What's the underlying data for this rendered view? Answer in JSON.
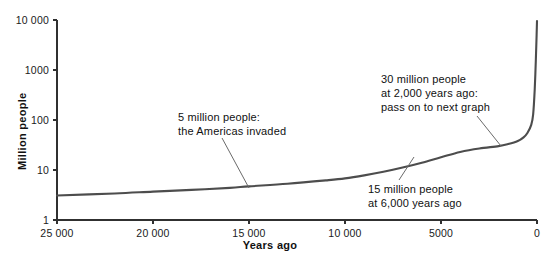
{
  "chart_data": {
    "type": "line",
    "title": "",
    "xlabel": "Years ago",
    "ylabel": "Million people",
    "xlim": [
      25000,
      0
    ],
    "ylim": [
      1,
      10000
    ],
    "yscale": "log",
    "xscale": "linear",
    "x_reversed": true,
    "grid": false,
    "legend": null,
    "xticks": [
      {
        "value": 25000,
        "label": "25 000",
        "px": 57
      },
      {
        "value": 20000,
        "label": "20 000",
        "px": 153
      },
      {
        "value": 15000,
        "label": "15 000",
        "px": 249
      },
      {
        "value": 10000,
        "label": "10 000",
        "px": 345
      },
      {
        "value": 5000,
        "label": "5000",
        "px": 441
      },
      {
        "value": 0,
        "label": "0",
        "px": 537
      }
    ],
    "yticks": [
      {
        "value": 1,
        "label": "1",
        "px": 220
      },
      {
        "value": 10,
        "label": "10",
        "px": 170
      },
      {
        "value": 100,
        "label": "100",
        "px": 120
      },
      {
        "value": 1000,
        "label": "1000",
        "px": 70
      },
      {
        "value": 10000,
        "label": "10 000",
        "px": 20
      }
    ],
    "series": [
      {
        "name": "World population",
        "units": "million people",
        "x": [
          25000,
          22000,
          20000,
          18000,
          16000,
          15000,
          13000,
          11000,
          10000,
          9000,
          8000,
          7000,
          6000,
          5000,
          4000,
          3000,
          2000,
          1500,
          1000,
          700,
          500,
          300,
          200,
          120,
          60,
          20,
          0
        ],
        "y": [
          3.1,
          3.4,
          3.7,
          4.0,
          4.4,
          4.7,
          5.3,
          6.2,
          6.8,
          7.8,
          9.2,
          11.2,
          14.0,
          18.0,
          23.0,
          27.0,
          30.0,
          33.0,
          38.0,
          45.0,
          55.0,
          80.0,
          130.0,
          400.0,
          1600.0,
          5000.0,
          9500.0
        ]
      }
    ],
    "annotations": [
      {
        "id": "americas-invaded",
        "lines": [
          "5 million people:",
          "the Americas invaded"
        ],
        "text_x": 178,
        "text_y": 110,
        "leader": {
          "x1": 222,
          "y1": 138,
          "x2": 249,
          "y2": 188
        },
        "data_point": {
          "years_ago": 15000,
          "million_people": 5
        }
      },
      {
        "id": "six-thousand-years",
        "lines": [
          "15 million people",
          "at 6,000 years ago"
        ],
        "text_x": 368,
        "text_y": 182,
        "leader": {
          "x1": 399,
          "y1": 180,
          "x2": 414,
          "y2": 157
        },
        "data_point": {
          "years_ago": 6000,
          "million_people": 15
        }
      },
      {
        "id": "two-thousand-years",
        "lines": [
          "30 million people",
          "at 2,000 years ago:",
          "pass on to next graph"
        ],
        "text_x": 381,
        "text_y": 72,
        "leader": {
          "x1": 477,
          "y1": 116,
          "x2": 501,
          "y2": 146
        },
        "data_point": {
          "years_ago": 2000,
          "million_people": 30
        }
      }
    ],
    "colors": {
      "curve": "#4d4d4d",
      "axis": "#303030",
      "text": "#111111",
      "background": "#ffffff",
      "leader": "#6a6a6a"
    }
  }
}
